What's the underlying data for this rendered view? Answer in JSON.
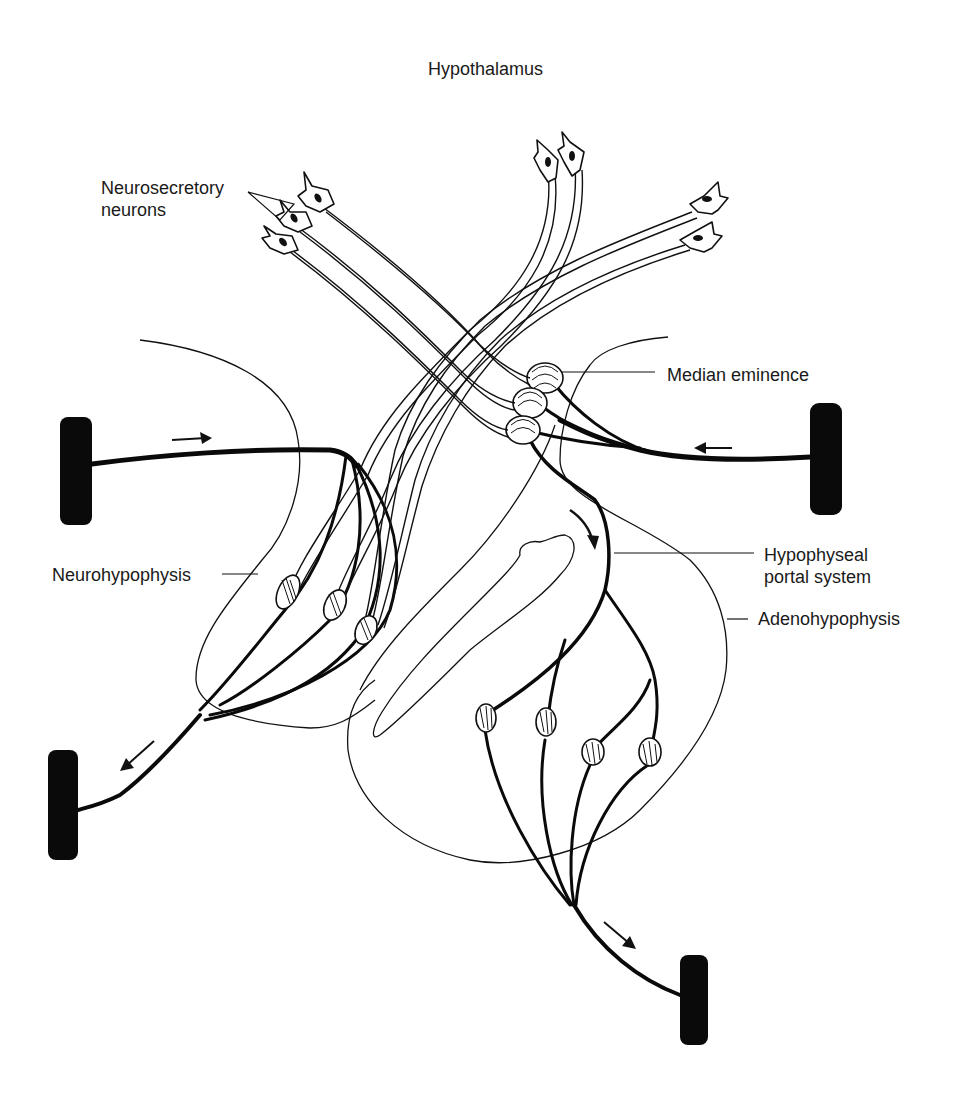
{
  "title": "Hypothalamus",
  "labels": {
    "neurosecretory_line1": "Neurosecretory",
    "neurosecretory_line2": "neurons",
    "median_eminence": "Median eminence",
    "neurohypophysis": "Neurohypophysis",
    "hypophyseal_line1": "Hypophyseal",
    "hypophyseal_line2": "portal system",
    "adenohypophysis": "Adenohypophysis"
  },
  "colors": {
    "ink": "#111111",
    "background": "#ffffff"
  },
  "structures": {
    "neuron_cell_bodies": 7,
    "capillary_plexus_median_eminence": 3,
    "axon_terminals_neurohypophysis": 3,
    "capillary_plexus_adenohypophysis": 4,
    "blood_vessels": 4,
    "flow_arrows": 4
  }
}
